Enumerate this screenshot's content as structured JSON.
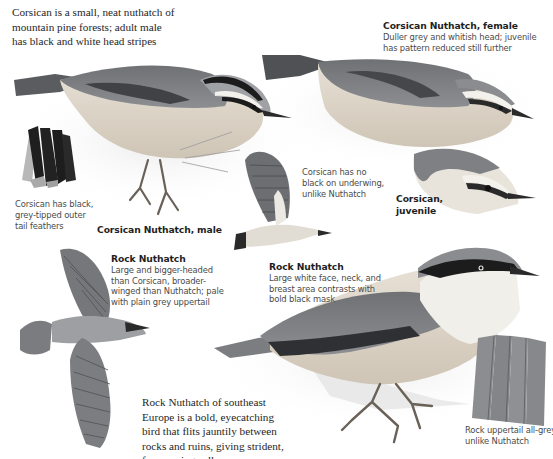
{
  "page": {
    "type": "field-guide-plate"
  },
  "captions": {
    "intro": {
      "lines": [
        "Corsican is a small, neat nuthatch of",
        "mountain pine forests; adult male",
        "has black and white head stripes"
      ]
    },
    "female": {
      "title": "Corsican Nuthatch, female",
      "lines": [
        "Duller grey and whitish head; juvenile",
        "has pattern reduced still further"
      ]
    },
    "tail": {
      "lines": [
        "Corsican has black,",
        "grey-tipped outer",
        "tail feathers"
      ]
    },
    "male": {
      "title": "Corsican Nuthatch, male"
    },
    "underwing": {
      "lines": [
        "Corsican has no",
        "black on underwing,",
        "unlike Nuthatch"
      ]
    },
    "juvenile": {
      "title_lines": [
        "Corsican,",
        "juvenile"
      ]
    },
    "rock_flight": {
      "title": "Rock Nuthatch",
      "lines": [
        "Large and bigger-headed",
        "than Corsican, broader-",
        "winged than Nuthatch; pale",
        "with plain grey uppertail"
      ]
    },
    "rock_perched": {
      "title": "Rock Nuthatch",
      "lines": [
        "Large white face, neck, and",
        "breast area contrasts with",
        "bold black mask"
      ]
    },
    "rock_intro": {
      "lines": [
        "Rock Nuthatch of southeast",
        "Europe is a bold, eyecatching",
        "bird that flits jauntily between",
        "rocks and ruins, giving strident,",
        "far-carrying calls"
      ]
    },
    "rock_tail": {
      "lines": [
        "Rock uppertail all-grey,",
        "unlike Nuthatch"
      ]
    }
  },
  "illustrations": [
    {
      "id": "corsican-male",
      "label": "Corsican Nuthatch, male"
    },
    {
      "id": "corsican-female",
      "label": "Corsican Nuthatch, female"
    },
    {
      "id": "corsican-tail",
      "label": "Corsican outer tail feathers"
    },
    {
      "id": "corsican-flight",
      "label": "Corsican underwing in flight"
    },
    {
      "id": "corsican-juvenile",
      "label": "Corsican, juvenile head"
    },
    {
      "id": "rock-flight",
      "label": "Rock Nuthatch in flight"
    },
    {
      "id": "rock-perched",
      "label": "Rock Nuthatch perched"
    },
    {
      "id": "rock-tail",
      "label": "Rock Nuthatch uppertail"
    }
  ],
  "colors": {
    "background": "#ffffff",
    "body_grey": "#7d7f82",
    "dark_grey": "#4e5053",
    "black_stripe": "#1c1c1c",
    "buff_underparts": "#dcd3c6",
    "white_face": "#f1efea",
    "text_dark": "#262626",
    "text_grey": "#4a4a4a"
  }
}
